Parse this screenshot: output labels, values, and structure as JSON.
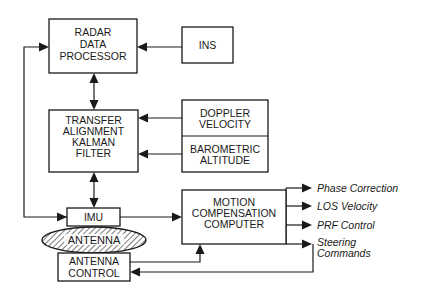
{
  "diagram": {
    "type": "block-diagram",
    "blocks": {
      "radar": {
        "lines": [
          "RADAR",
          "DATA",
          "PROCESSOR"
        ]
      },
      "ins": {
        "lines": [
          "INS"
        ]
      },
      "kalman": {
        "lines": [
          "TRANSFER",
          "ALIGNMENT",
          "KALMAN",
          "FILTER"
        ]
      },
      "doppler": {
        "lines": [
          "DOPPLER",
          "VELOCITY"
        ]
      },
      "baro": {
        "lines": [
          "BAROMETRIC",
          "ALTITUDE"
        ]
      },
      "imu": {
        "lines": [
          "IMU"
        ]
      },
      "antenna": {
        "lines": [
          "ANTENNA"
        ]
      },
      "antenna_control": {
        "lines": [
          "ANTENNA",
          "CONTROL"
        ]
      },
      "motion": {
        "lines": [
          "MOTION",
          "COMPENSATION",
          "COMPUTER"
        ]
      }
    },
    "outputs": [
      {
        "lines": [
          "Phase Correction"
        ]
      },
      {
        "lines": [
          "LOS Velocity"
        ]
      },
      {
        "lines": [
          "PRF Control"
        ]
      },
      {
        "lines": [
          "Steering",
          "Commands"
        ]
      }
    ],
    "edges": [
      {
        "from": "ins",
        "to": "radar"
      },
      {
        "from": "radar",
        "to": "kalman",
        "bidirectional": true
      },
      {
        "from": "doppler",
        "to": "kalman"
      },
      {
        "from": "baro",
        "to": "kalman"
      },
      {
        "from": "kalman",
        "to": "imu",
        "bidirectional": true
      },
      {
        "from": "imu",
        "to": "radar"
      },
      {
        "from": "imu",
        "to": "motion"
      },
      {
        "from": "antenna_control",
        "to": "motion"
      },
      {
        "from": "motion",
        "to": "Phase Correction"
      },
      {
        "from": "motion",
        "to": "LOS Velocity"
      },
      {
        "from": "motion",
        "to": "PRF Control"
      },
      {
        "from": "motion",
        "to": "Steering Commands"
      },
      {
        "from": "motion",
        "to": "antenna_control"
      }
    ]
  }
}
